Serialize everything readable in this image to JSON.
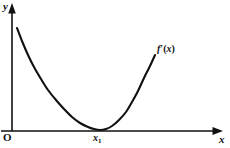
{
  "figure": {
    "type": "math-graph",
    "background_color": "#ffffff",
    "ink_color": "#111111",
    "axes": {
      "y_axis_label": "y",
      "x_axis_label": "x",
      "origin_label": "O",
      "y_axis_x_px": 12,
      "x_axis_y_px": 131,
      "y_axis_top_px": 4,
      "x_axis_right_px": 222,
      "arrowheads": "filled-triangle"
    },
    "ticks": {
      "x": [
        {
          "label": "x",
          "subscript": "1",
          "x_px": 100
        }
      ]
    },
    "curve": {
      "label_f": "f",
      "label_prime": "′",
      "label_arg": "(x)",
      "label_full": "f′(x)",
      "stroke_color": "#111111",
      "stroke_width_px": 2.1
    }
  },
  "chart_data": {
    "type": "line",
    "title": "",
    "xlabel": "x",
    "ylabel": "y",
    "grid": false,
    "legend": "none",
    "annotations": [
      {
        "text": "f′(x)",
        "x_px": 157,
        "y_px": 44,
        "role": "curve-label"
      },
      {
        "text": "x₁",
        "x_px": 100,
        "y_px": 137,
        "role": "x-tick-label"
      },
      {
        "text": "O",
        "x_px": 5,
        "y_px": 138,
        "role": "origin-label"
      }
    ],
    "series": [
      {
        "name": "f'(x)",
        "comment": "Convex curve tangent to the x-axis at x1; pixel coordinates in image space.",
        "points_px": [
          [
            17,
            28
          ],
          [
            22,
            41
          ],
          [
            28,
            55
          ],
          [
            34,
            67
          ],
          [
            41,
            79
          ],
          [
            48,
            90
          ],
          [
            56,
            100
          ],
          [
            64,
            109
          ],
          [
            72,
            117
          ],
          [
            80,
            123
          ],
          [
            88,
            127
          ],
          [
            94,
            129
          ],
          [
            100,
            130
          ],
          [
            106,
            129
          ],
          [
            112,
            126
          ],
          [
            119,
            120
          ],
          [
            126,
            112
          ],
          [
            132,
            102
          ],
          [
            138,
            91
          ],
          [
            144,
            78
          ],
          [
            150,
            66
          ],
          [
            155,
            55
          ]
        ]
      }
    ],
    "axis_ranges_px": {
      "x": [
        12,
        222
      ],
      "y": [
        131,
        4
      ]
    }
  }
}
